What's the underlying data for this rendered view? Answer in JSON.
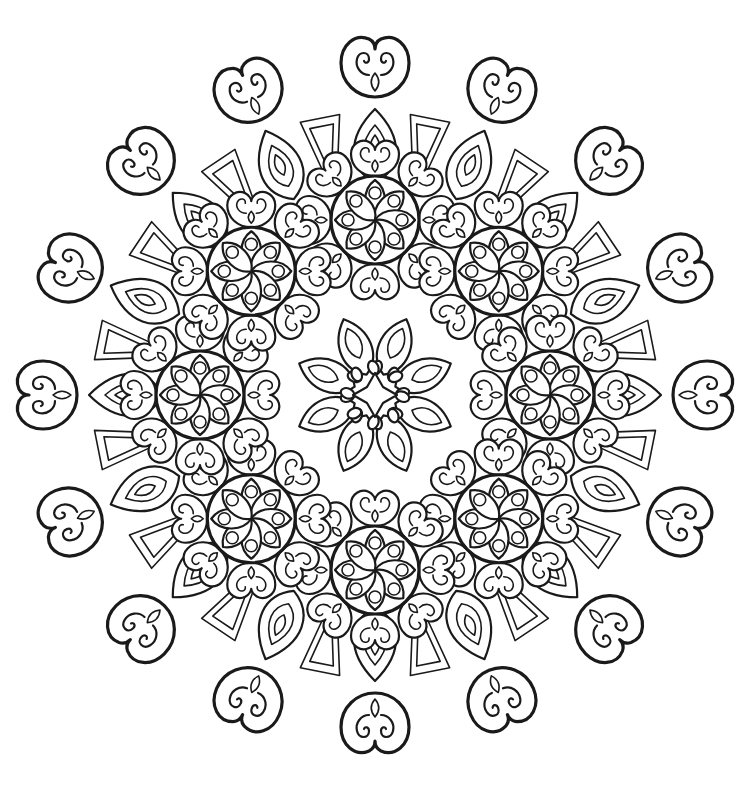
{
  "image": {
    "title": "Mandala coloring page",
    "description": "Black-and-white line-art mandala with an outer ring of heart-shaped scroll motifs, a ring of teardrop petals, eight flower medallions and a central six-petal star",
    "background_color": "#ffffff",
    "line_color": "#1a1a1a"
  },
  "mandala": {
    "center": [
      375,
      395
    ],
    "outer_radius": 355,
    "outer_scroll_count": 16,
    "teardrop_ring_count": 16,
    "medallion_count": 8,
    "medallion_radius": 175,
    "medallion_petals": 8,
    "central_star_petals": 8
  }
}
